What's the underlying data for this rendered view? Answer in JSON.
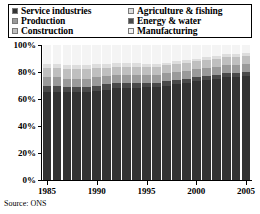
{
  "legend": {
    "left_column": [
      {
        "label": "Service industries",
        "swatch": "#333333",
        "key": "service"
      },
      {
        "label": "Production",
        "swatch": "#9a9a9a",
        "key": "production"
      },
      {
        "label": "Construction",
        "swatch": "#bfbfbf",
        "key": "construction"
      }
    ],
    "right_column": [
      {
        "label": "Agriculture & fishing",
        "swatch": "#dddddd",
        "key": "agriculture"
      },
      {
        "label": "Energy & water",
        "swatch": "#4a4a4a",
        "key": "energy"
      },
      {
        "label": "Manufacturing",
        "swatch": "#f2f2f2",
        "key": "manufacturing"
      }
    ]
  },
  "source": "Source: ONS",
  "chart_data": {
    "type": "bar",
    "stacked": true,
    "stack_mode": "percent",
    "title": "",
    "xlabel": "",
    "ylabel": "",
    "ylim": [
      0,
      100
    ],
    "ytick_labels": [
      "0%",
      "20%",
      "40%",
      "60%",
      "80%",
      "100%"
    ],
    "ytick_values": [
      0,
      20,
      40,
      60,
      80,
      100
    ],
    "xtick_labels": [
      "1985",
      "1990",
      "1995",
      "2000",
      "2005"
    ],
    "xtick_values": [
      1985,
      1990,
      1995,
      2000,
      2005
    ],
    "grid": false,
    "legend_position": "top",
    "categories": [
      1985,
      1986,
      1987,
      1988,
      1989,
      1990,
      1991,
      1992,
      1993,
      1994,
      1995,
      1996,
      1997,
      1998,
      1999,
      2000,
      2001,
      2002,
      2003,
      2004,
      2005
    ],
    "series": [
      {
        "name": "Service industries",
        "color": "#333333",
        "values": [
          65,
          65,
          65,
          65,
          65,
          66,
          67,
          68,
          68,
          68,
          69,
          69,
          70,
          71,
          72,
          73,
          74,
          75,
          76,
          76,
          77
        ]
      },
      {
        "name": "Energy & water",
        "color": "#4a4a4a",
        "values": [
          5,
          5,
          4,
          4,
          4,
          4,
          4,
          4,
          4,
          4,
          3,
          3,
          3,
          3,
          3,
          3,
          3,
          3,
          3,
          3,
          3
        ]
      },
      {
        "name": "Production",
        "color": "#9a9a9a",
        "values": [
          6,
          6,
          6,
          6,
          6,
          6,
          6,
          6,
          6,
          6,
          6,
          6,
          6,
          6,
          6,
          6,
          6,
          6,
          6,
          6,
          6
        ]
      },
      {
        "name": "Construction",
        "color": "#bfbfbf",
        "values": [
          7,
          7,
          7,
          7,
          7,
          7,
          6,
          6,
          6,
          6,
          6,
          6,
          6,
          6,
          6,
          6,
          6,
          6,
          6,
          6,
          6
        ]
      },
      {
        "name": "Agriculture & fishing",
        "color": "#dddddd",
        "values": [
          3,
          3,
          3,
          3,
          3,
          3,
          3,
          3,
          3,
          3,
          2,
          2,
          2,
          2,
          2,
          2,
          2,
          2,
          2,
          2,
          2
        ]
      },
      {
        "name": "Manufacturing",
        "color": "#f4f4f4",
        "values": [
          14,
          14,
          15,
          15,
          15,
          14,
          14,
          13,
          13,
          13,
          14,
          14,
          13,
          12,
          11,
          10,
          9,
          8,
          7,
          7,
          6
        ]
      }
    ]
  }
}
